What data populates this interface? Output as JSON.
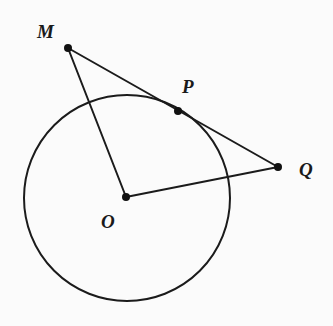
{
  "diagram": {
    "title": "",
    "colors": {
      "background": "#fbfbfb",
      "line": "#1b1b1b",
      "point": "#111111"
    },
    "circle": {
      "name": "circle-O",
      "center_point": "O",
      "cx": 127,
      "cy": 198,
      "r": 103
    },
    "points": [
      {
        "id": "M",
        "label": "M",
        "x": 68,
        "y": 48,
        "label_x": 37,
        "label_y": 38
      },
      {
        "id": "P",
        "label": "P",
        "x": 178,
        "y": 111,
        "label_x": 182,
        "label_y": 93
      },
      {
        "id": "Q",
        "label": "Q",
        "x": 278,
        "y": 167,
        "label_x": 299,
        "label_y": 176
      },
      {
        "id": "O",
        "label": "O",
        "x": 126,
        "y": 197,
        "label_x": 101,
        "label_y": 228
      }
    ],
    "segments": [
      {
        "id": "MQ",
        "from": "M",
        "to": "Q",
        "note": "tangent line through P"
      },
      {
        "id": "MO",
        "from": "M",
        "to": "O"
      },
      {
        "id": "OQ",
        "from": "O",
        "to": "Q"
      }
    ],
    "labels": {
      "M": "M",
      "P": "P",
      "Q": "Q",
      "O": "O"
    }
  }
}
